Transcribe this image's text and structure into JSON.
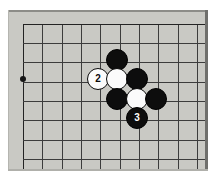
{
  "diagram": {
    "type": "go-board",
    "caption": "",
    "board": {
      "background_color": "#c9c9c4",
      "line_color": "#3c3c3c",
      "edge_color": "#232323",
      "origin_x": 23,
      "origin_y": 24,
      "spacing": 19.3,
      "columns": 10,
      "rows": 8,
      "vertical_lines_x": [
        23,
        42,
        62,
        81,
        100,
        120,
        139,
        158,
        178,
        197
      ],
      "horizontal_lines_y": [
        24,
        43,
        62,
        82,
        101,
        120,
        140,
        159
      ],
      "top_edge_y": 24,
      "left_edge_x": 23
    },
    "star_points": [
      {
        "name": "hoshi-left",
        "x": 23,
        "y": 79,
        "radius": 3
      }
    ],
    "stones": [
      {
        "id": "stone-black-top",
        "color": "black",
        "label": "",
        "x": 117,
        "y": 60,
        "radius": 11
      },
      {
        "id": "stone-white-2",
        "color": "white",
        "label": "2",
        "x": 98,
        "y": 79,
        "radius": 11
      },
      {
        "id": "stone-white-center",
        "color": "white",
        "label": "",
        "x": 117,
        "y": 79,
        "radius": 11
      },
      {
        "id": "stone-black-right-upper",
        "color": "black",
        "label": "",
        "x": 137,
        "y": 79,
        "radius": 11
      },
      {
        "id": "stone-black-left-lower",
        "color": "black",
        "label": "",
        "x": 117,
        "y": 99,
        "radius": 11
      },
      {
        "id": "stone-white-lower",
        "color": "white",
        "label": "",
        "x": 137,
        "y": 99,
        "radius": 11
      },
      {
        "id": "stone-black-right-lower",
        "color": "black",
        "label": "",
        "x": 156,
        "y": 99,
        "radius": 11
      },
      {
        "id": "stone-black-3",
        "color": "black",
        "label": "3",
        "x": 137,
        "y": 118,
        "radius": 11
      }
    ],
    "move_labels": [
      {
        "number": "2",
        "stone_color": "white",
        "text_color": "#0a0a0a"
      },
      {
        "number": "3",
        "stone_color": "black",
        "text_color": "#ffffff"
      }
    ],
    "colors": {
      "board": "#c9c9c4",
      "lines": "#3c3c3c",
      "black_stone": "#0d0d0d",
      "white_stone": "#fbfbfb",
      "page_background": "#ffffff"
    }
  }
}
